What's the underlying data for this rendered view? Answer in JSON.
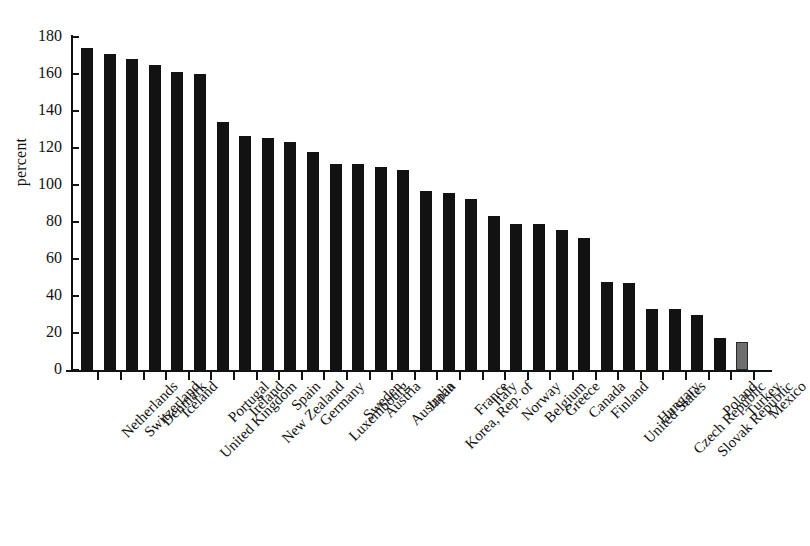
{
  "chart_data": {
    "type": "bar",
    "title": "",
    "xlabel": "",
    "ylabel": "percent",
    "ylim": [
      0,
      180
    ],
    "yticks": [
      0,
      20,
      40,
      60,
      80,
      100,
      120,
      140,
      160,
      180
    ],
    "grid": false,
    "legend": null,
    "categories": [
      "Netherlands",
      "Switzerland",
      "Denmark",
      "Iceland",
      "United Kingdom",
      "Portugal",
      "Ireland",
      "New Zealand",
      "Spain",
      "Germany",
      "Luxembourg",
      "Sweden",
      "Austria",
      "Australia",
      "Japan",
      "Korea, Rep. of",
      "France",
      "Italy",
      "Norway",
      "Belgium",
      "Greece",
      "Canada",
      "Finland",
      "United States",
      "Hungary",
      "Czech Republic",
      "Slovak Republic",
      "Poland",
      "Turkey",
      "Mexico"
    ],
    "values": [
      174,
      171,
      168,
      165,
      161,
      160,
      134,
      126.5,
      125.5,
      123,
      118,
      111.5,
      111.5,
      110,
      108,
      96.5,
      95.5,
      92.5,
      83.5,
      79,
      79,
      75.5,
      71.5,
      47.5,
      47,
      33,
      33,
      29.5,
      17.5,
      15
    ],
    "bar_colors": [
      "#121212",
      "#121212",
      "#121212",
      "#121212",
      "#121212",
      "#121212",
      "#121212",
      "#121212",
      "#121212",
      "#121212",
      "#121212",
      "#121212",
      "#121212",
      "#121212",
      "#121212",
      "#121212",
      "#121212",
      "#121212",
      "#121212",
      "#121212",
      "#121212",
      "#121212",
      "#121212",
      "#121212",
      "#121212",
      "#121212",
      "#121212",
      "#121212",
      "#121212",
      "#6e6e6e"
    ]
  }
}
